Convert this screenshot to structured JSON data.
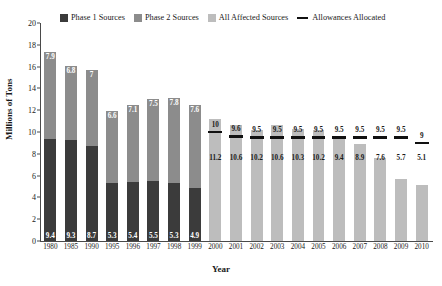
{
  "chart_data": {
    "type": "bar",
    "title": "",
    "xlabel": "Year",
    "ylabel": "Millions of Tons",
    "ylim": [
      0,
      20
    ],
    "ytick_step": 2,
    "yticks": [
      "0",
      "2",
      "4",
      "6",
      "8",
      "10",
      "12",
      "14",
      "16",
      "18",
      "20"
    ],
    "grid": false,
    "legend_position": "top",
    "categories": [
      "1980",
      "1985",
      "1990",
      "1995",
      "1996",
      "1997",
      "1998",
      "1999",
      "2000",
      "2001",
      "2002",
      "2003",
      "2004",
      "2005",
      "2006",
      "2007",
      "2008",
      "2009",
      "2010"
    ],
    "series": [
      {
        "name": "Phase 1 Sources",
        "color": "#3b3b3b",
        "values": [
          9.4,
          9.3,
          8.7,
          5.3,
          5.4,
          5.5,
          5.3,
          4.9,
          null,
          null,
          null,
          null,
          null,
          null,
          null,
          null,
          null,
          null,
          null
        ]
      },
      {
        "name": "Phase 2 Sources",
        "color": "#8c8c8c",
        "values": [
          7.9,
          6.8,
          7.0,
          6.6,
          7.1,
          7.5,
          7.8,
          7.6,
          null,
          null,
          null,
          null,
          null,
          null,
          null,
          null,
          null,
          null,
          null
        ]
      },
      {
        "name": "All Affected Sources",
        "color": "#bdbdbd",
        "values": [
          null,
          null,
          null,
          null,
          null,
          null,
          null,
          null,
          11.2,
          10.6,
          10.2,
          10.6,
          10.3,
          10.2,
          9.4,
          8.9,
          7.6,
          5.7,
          5.1
        ]
      },
      {
        "name": "Allowances Allocated",
        "color": "#111111",
        "type": "marker",
        "values": [
          null,
          null,
          null,
          null,
          null,
          null,
          null,
          null,
          10,
          9.6,
          9.5,
          9.5,
          9.5,
          9.5,
          9.5,
          9.5,
          9.5,
          9.5,
          9
        ]
      }
    ]
  },
  "legend": {
    "items": [
      {
        "label": "Phase 1 Sources",
        "color": "#3b3b3b",
        "swatch": "square"
      },
      {
        "label": "Phase 2 Sources",
        "color": "#8c8c8c",
        "swatch": "square"
      },
      {
        "label": "All Affected Sources",
        "color": "#bdbdbd",
        "swatch": "square"
      },
      {
        "label": "Allowances Allocated",
        "color": "#111111",
        "swatch": "dash"
      }
    ]
  }
}
